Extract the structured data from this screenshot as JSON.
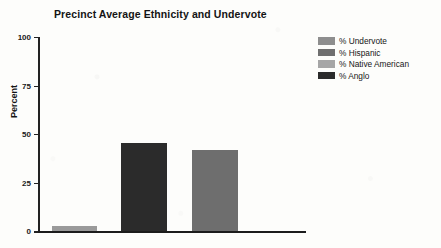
{
  "chart_data": {
    "type": "bar",
    "title": "Precinct Average Ethnicity and Undervote",
    "xlabel": "",
    "ylabel": "Percent",
    "ylim": [
      0,
      100
    ],
    "yticks": [
      0,
      25,
      50,
      75,
      100
    ],
    "ytick_labels": [
      "0",
      "25",
      "50",
      "75",
      "100"
    ],
    "grid": false,
    "legend_position": "right",
    "categories": [
      "% Undervote",
      "% Hispanic",
      "% Native American",
      "% Anglo"
    ],
    "series": [
      {
        "name": "Precinct Average",
        "values": [
          2.8,
          45.6,
          42.0,
          0
        ]
      }
    ],
    "bars": [
      {
        "label": "% Undervote",
        "value": 2.8,
        "color": "#9a9a9a"
      },
      {
        "label": "% Anglo",
        "value": 45.6,
        "color": "#2b2b2b"
      },
      {
        "label": "% Native American",
        "value": 42.0,
        "color": "#6e6e6e"
      }
    ],
    "legend": [
      {
        "label": "% Undervote",
        "color": "#8e8e8e"
      },
      {
        "label": "% Hispanic",
        "color": "#6f6f6f"
      },
      {
        "label": "% Native American",
        "color": "#a6a6a6"
      },
      {
        "label": "% Anglo",
        "color": "#2b2b2b"
      }
    ]
  },
  "colors": {
    "axis": "#1c1c1c",
    "text": "#141414",
    "background": "#fdfdfb"
  }
}
